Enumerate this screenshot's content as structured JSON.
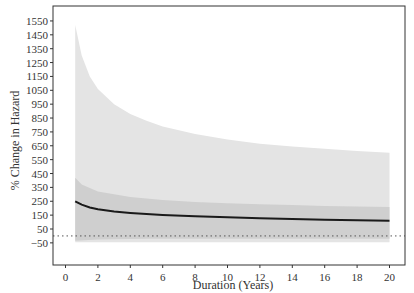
{
  "chart_data": {
    "type": "line",
    "title": "",
    "xlabel": "Duration (Years)",
    "ylabel": "% Change in Hazard",
    "xlim": [
      -0.8,
      21
    ],
    "ylim": [
      -130,
      1600
    ],
    "x_ticks": [
      0,
      2,
      4,
      6,
      8,
      10,
      12,
      14,
      16,
      18,
      20
    ],
    "y_ticks": [
      -50,
      50,
      150,
      250,
      350,
      450,
      550,
      650,
      750,
      850,
      950,
      1050,
      1150,
      1250,
      1350,
      1450,
      1550
    ],
    "grid": false,
    "legend": null,
    "reference_line": {
      "y": 0,
      "style": "dotted",
      "color": "#555555"
    },
    "colors": {
      "line": "#1a1a1a",
      "outer_band": "#e4e4e4",
      "inner_band": "#cfcfcf",
      "axis": "#333333"
    },
    "series": [
      {
        "name": "estimate",
        "x": [
          0.6,
          1,
          1.5,
          2,
          3,
          4,
          5,
          6,
          8,
          10,
          12,
          14,
          16,
          18,
          20
        ],
        "values": [
          250,
          225,
          205,
          192,
          176,
          166,
          158,
          152,
          142,
          134,
          128,
          122,
          117,
          113,
          110
        ]
      },
      {
        "name": "outer_ci_upper",
        "x": [
          0.6,
          1,
          1.5,
          2,
          3,
          4,
          5,
          6,
          8,
          10,
          12,
          14,
          16,
          18,
          20
        ],
        "values": [
          1520,
          1300,
          1150,
          1060,
          950,
          880,
          830,
          790,
          735,
          695,
          665,
          645,
          628,
          612,
          600
        ]
      },
      {
        "name": "outer_ci_lower",
        "x": [
          0.6,
          20
        ],
        "values": [
          -45,
          -45
        ]
      },
      {
        "name": "inner_ci_upper",
        "x": [
          0.6,
          1,
          2,
          4,
          6,
          8,
          10,
          12,
          14,
          16,
          18,
          20
        ],
        "values": [
          420,
          370,
          320,
          280,
          260,
          245,
          235,
          228,
          222,
          216,
          212,
          208
        ]
      },
      {
        "name": "inner_ci_lower",
        "x": [
          0.6,
          2,
          5,
          10,
          15,
          20
        ],
        "values": [
          -35,
          -25,
          -20,
          -20,
          -20,
          -20
        ]
      }
    ]
  }
}
